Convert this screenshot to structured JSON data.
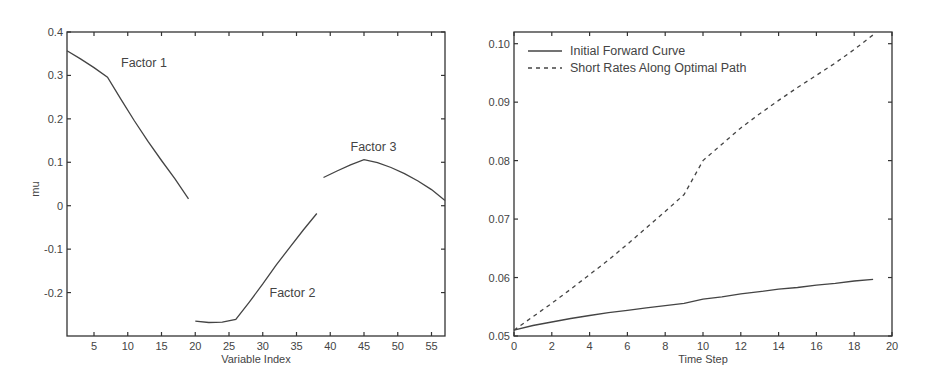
{
  "chart_data": [
    {
      "type": "line",
      "title": "",
      "xlabel": "Variable Index",
      "ylabel": "mu",
      "xlim": [
        1,
        57
      ],
      "ylim": [
        -0.3,
        0.4
      ],
      "grid": false,
      "xticks": [
        5,
        10,
        15,
        20,
        25,
        30,
        35,
        40,
        45,
        50,
        55
      ],
      "yticks": [
        -0.2,
        -0.1,
        0,
        0.1,
        0.2,
        0.3,
        0.4
      ],
      "ytick_labels": [
        "-0.2",
        "-0.1",
        "0",
        "0.1",
        "0.2",
        "0.3",
        "0.4"
      ],
      "annotations": [
        {
          "text": "Factor 1",
          "x": 9,
          "y": 0.32
        },
        {
          "text": "Factor 2",
          "x": 31,
          "y": -0.21
        },
        {
          "text": "Factor 3",
          "x": 43,
          "y": 0.125
        }
      ],
      "series": [
        {
          "name": "Factor 1",
          "style": "solid",
          "x": [
            1,
            3,
            5,
            7,
            9,
            11,
            13,
            15,
            17,
            19
          ],
          "y": [
            0.357,
            0.338,
            0.318,
            0.296,
            0.245,
            0.195,
            0.148,
            0.104,
            0.062,
            0.016
          ]
        },
        {
          "name": "Factor 2",
          "style": "solid",
          "x": [
            20,
            22,
            24,
            26,
            28,
            30,
            32,
            34,
            36,
            38
          ],
          "y": [
            -0.266,
            -0.269,
            -0.268,
            -0.262,
            -0.222,
            -0.18,
            -0.136,
            -0.096,
            -0.056,
            -0.018
          ]
        },
        {
          "name": "Factor 3",
          "style": "solid",
          "x": [
            39,
            41,
            43,
            45,
            47,
            49,
            51,
            53,
            55,
            57
          ],
          "y": [
            0.065,
            0.08,
            0.094,
            0.106,
            0.099,
            0.088,
            0.074,
            0.057,
            0.037,
            0.012
          ]
        }
      ]
    },
    {
      "type": "line",
      "title": "",
      "xlabel": "Time Step",
      "ylabel": "",
      "xlim": [
        0,
        20
      ],
      "ylim": [
        0.05,
        0.102
      ],
      "grid": false,
      "xticks": [
        0,
        2,
        4,
        6,
        8,
        10,
        12,
        14,
        16,
        18,
        20
      ],
      "yticks": [
        0.05,
        0.06,
        0.07,
        0.08,
        0.09,
        0.1
      ],
      "ytick_labels": [
        "0.05",
        "0.06",
        "0.07",
        "0.08",
        "0.09",
        "0.10"
      ],
      "legend_position": "upper left",
      "series": [
        {
          "name": "Initial Forward Curve",
          "style": "solid",
          "x": [
            0,
            1,
            2,
            3,
            4,
            5,
            6,
            7,
            8,
            9,
            10,
            11,
            12,
            13,
            14,
            15,
            16,
            17,
            18,
            19
          ],
          "y": [
            0.051,
            0.0518,
            0.0524,
            0.053,
            0.0535,
            0.054,
            0.0544,
            0.0548,
            0.0552,
            0.0556,
            0.0563,
            0.0567,
            0.0572,
            0.0576,
            0.058,
            0.0583,
            0.0587,
            0.059,
            0.0594,
            0.0597
          ]
        },
        {
          "name": "Short Rates Along Optimal Path",
          "style": "dashed",
          "x": [
            0,
            1,
            2,
            3,
            4,
            5,
            6,
            7,
            8,
            9,
            10,
            11,
            12,
            13,
            14,
            15,
            16,
            17,
            18,
            19
          ],
          "y": [
            0.051,
            0.0533,
            0.0556,
            0.058,
            0.0605,
            0.063,
            0.0657,
            0.0685,
            0.0713,
            0.0742,
            0.08,
            0.0828,
            0.0856,
            0.088,
            0.0903,
            0.0925,
            0.0946,
            0.0967,
            0.099,
            0.1015
          ]
        }
      ]
    }
  ]
}
